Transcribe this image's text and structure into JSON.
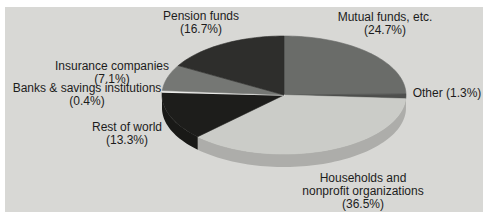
{
  "figure": {
    "background_color": "#d8d8d5",
    "page_color": "#ffffff",
    "text_color": "#1c1c1c"
  },
  "chart_data": {
    "type": "pie",
    "title": "",
    "effect": "3d",
    "start_angle_deg": 0,
    "direction": "clockwise",
    "unit": "percent",
    "slices": [
      {
        "label": "Mutual funds, etc.",
        "value": 24.7,
        "color": "#6a6c69"
      },
      {
        "label": "Other",
        "value": 1.3,
        "color": "#4e4f4d"
      },
      {
        "label": "Households and nonprofit organizations",
        "value": 36.5,
        "color": "#cbccc8"
      },
      {
        "label": "Rest of world",
        "value": 13.3,
        "color": "#1d1d1b"
      },
      {
        "label": "Banks & savings institutions",
        "value": 0.4,
        "color": "#eaeae8"
      },
      {
        "label": "Insurance companies",
        "value": 7.1,
        "color": "#757774"
      },
      {
        "label": "Pension funds",
        "value": 16.7,
        "color": "#2e2e2c"
      }
    ]
  },
  "labels": {
    "pension": {
      "line1": "Pension funds",
      "line2": "(16.7%)"
    },
    "mutual": {
      "line1": "Mutual funds, etc.",
      "line2": "(24.7%)"
    },
    "insurance": {
      "line1": "Insurance companies",
      "line2": "(7.1%)"
    },
    "banks": {
      "line1": "Banks & savings institutions",
      "line2": "(0.4%)"
    },
    "rest_of_world": {
      "line1": "Rest of world",
      "line2": "(13.3%)"
    },
    "other": {
      "line1": "Other (1.3%)"
    },
    "households": {
      "line1": "Households and",
      "line2": "nonprofit organizations",
      "line3": "(36.5%)"
    }
  }
}
